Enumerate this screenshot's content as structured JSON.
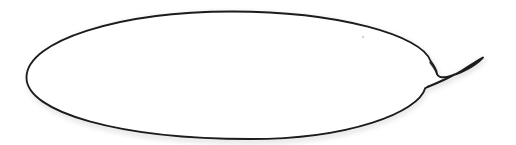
{
  "image": {
    "kind": "line-drawing",
    "subject": "speech-balloon",
    "title": "Empty speech balloon outline",
    "width": 516,
    "height": 145,
    "background_color": "#ffffff",
    "stroke_color": "#1b1b1b",
    "halo_color": "#d8d8d8",
    "fill_color": "#ffffff",
    "text_content": "",
    "has_text": false
  },
  "balloon": {
    "body": {
      "shape_name": "ellipse-body",
      "center_x": 228,
      "center_y": 75,
      "radius_x": 202,
      "radius_y": 64,
      "leftmost_point": [
        26,
        78
      ],
      "topmost_point": [
        232,
        11
      ],
      "bottommost_point": [
        250,
        139
      ],
      "stroke_width_min": 1.4,
      "stroke_width_max": 2.6
    },
    "tail": {
      "shape_name": "hook-tail",
      "direction": "right",
      "tip_point": [
        483,
        58
      ],
      "upper_junction": [
        430,
        61
      ],
      "lower_junction": [
        425,
        88
      ],
      "notch_point": [
        437,
        74
      ],
      "style": "crescent-claw"
    },
    "artifacts": [
      {
        "name": "scan-speck",
        "x": 363,
        "y": 37,
        "radius": 1.2,
        "color": "#c9c9c9"
      }
    ]
  },
  "svg_paths": {
    "balloon_outline": "M 430.5 61.0 C 422.0 35.5 338.0 11.5 232.0 11.5 C 120.0 11.5 26.5 40.5 26.5 77.5 C 26.5 112.5 120.0 139.0 250.0 139.0 C 350.0 139.0 418.5 112.0 425.2 88.2 C 433.0 85.0 449.0 78.5 462.0 70.5 C 470.5 65.2 478.0 60.0 483.0 57.5 C 474.5 66.5 459.0 74.5 447.0 76.8 C 441.0 78.0 437.5 76.5 437.0 73.8 C 436.5 69.0 433.0 64.5 430.5 61.0 Z",
    "halo_underlay": "M 430.5 63.5 C 422.0 38.0 338.0 14.0 232.0 14.0 C 120.0 14.0 29.0 43.0 29.0 80.0 C 29.0 115.0 120.0 141.5 250.0 141.5 C 350.0 141.5 418.5 114.5 425.2 90.7 C 433.0 87.5 449.0 81.0 462.0 73.0 C 470.5 67.7 478.0 62.5 483.0 60.0 C 474.5 69.0 459.0 77.0 447.0 79.3 C 441.0 80.5 437.5 79.0 437.0 76.3 C 436.5 71.5 433.0 67.0 430.5 63.5 Z"
  }
}
